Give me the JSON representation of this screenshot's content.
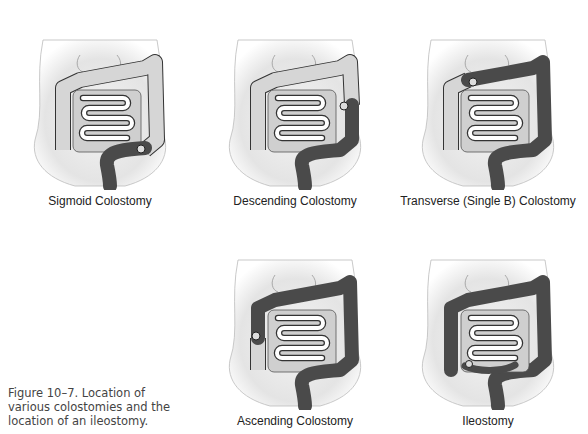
{
  "figure": {
    "caption": "Figure 10–7.  Location of various colostomies and the location of an ileostomy."
  },
  "colors": {
    "colon_dark": "#4a4a4a",
    "colon_light": "#d6d6d6",
    "intestine_fill": "#ffffff",
    "outline": "#333333",
    "body_shade": "#e2e2e2"
  },
  "panels": [
    {
      "id": "sigmoid",
      "label": "Sigmoid Colostomy",
      "dark_segments": [
        "sigmoid"
      ],
      "stoma": "sigmoid"
    },
    {
      "id": "descending",
      "label": "Descending Colostomy",
      "dark_segments": [
        "descending-lower",
        "sigmoid"
      ],
      "stoma": "descending"
    },
    {
      "id": "transverse",
      "label": "Transverse (Single B) Colostomy",
      "dark_segments": [
        "transverse-right",
        "descending",
        "sigmoid"
      ],
      "stoma": "transverse"
    },
    {
      "id": "ascending",
      "label": "Ascending Colostomy",
      "dark_segments": [
        "ascending-upper",
        "transverse",
        "descending",
        "sigmoid"
      ],
      "stoma": "ascending"
    },
    {
      "id": "ileostomy",
      "label": "Ileostomy",
      "dark_segments": [
        "ascending",
        "transverse",
        "descending",
        "sigmoid",
        "terminal-ileum"
      ],
      "stoma": "ileum"
    }
  ]
}
